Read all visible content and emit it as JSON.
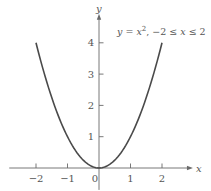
{
  "chart_data": {
    "type": "line",
    "title": "",
    "xlabel": "x",
    "ylabel": "y",
    "xlim": [
      -2.85,
      2.95
    ],
    "ylim": [
      -0.7,
      4.9
    ],
    "grid": false,
    "x_ticks": [
      -2,
      -1,
      0,
      1,
      2
    ],
    "x_tick_labels": [
      "−2",
      "−1",
      "0",
      "1",
      "2"
    ],
    "y_ticks": [
      1,
      2,
      3,
      4
    ],
    "y_tick_labels": [
      "1",
      "2",
      "3",
      "4"
    ],
    "series": [
      {
        "name": "y = x^2",
        "function": "x^2",
        "domain": [
          -2,
          2
        ],
        "x": [
          -2,
          -1.5,
          -1,
          -0.5,
          0,
          0.5,
          1,
          1.5,
          2
        ],
        "y": [
          4,
          2.25,
          1,
          0.25,
          0,
          0.25,
          1,
          2.25,
          4
        ]
      }
    ],
    "annotation": {
      "y_var": "y",
      "equals": " = ",
      "x_var": "x",
      "exponent": "2",
      "domain_text_prefix": ",  −2 ≤ ",
      "domain_var": "x",
      "domain_text_suffix": " ≤ 2"
    }
  },
  "colors": {
    "curve": "#4a4a4a",
    "axis": "#6a6a6a",
    "text": "#555555"
  }
}
